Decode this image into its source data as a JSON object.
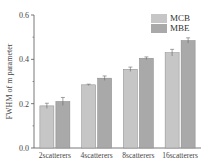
{
  "chart_data": {
    "type": "bar",
    "title": "",
    "xlabel": "",
    "ylabel": "FWHM of m parameter",
    "ylim": [
      0.0,
      0.6
    ],
    "yticks": [
      "0.0",
      "0.2",
      "0.4",
      "0.6"
    ],
    "categories": [
      "2scatterers",
      "4scatterers",
      "8scatterers",
      "16scatterers"
    ],
    "series": [
      {
        "name": "MCB",
        "color": "#c6c6c6",
        "values": [
          0.19,
          0.285,
          0.355,
          0.43
        ],
        "errors": [
          0.012,
          0.003,
          0.01,
          0.015
        ]
      },
      {
        "name": "MBE",
        "color": "#a9a9a9",
        "values": [
          0.21,
          0.315,
          0.405,
          0.485
        ],
        "errors": [
          0.018,
          0.01,
          0.006,
          0.012
        ]
      }
    ],
    "legend_position": "top-right",
    "grid": false,
    "error_bars": true
  }
}
